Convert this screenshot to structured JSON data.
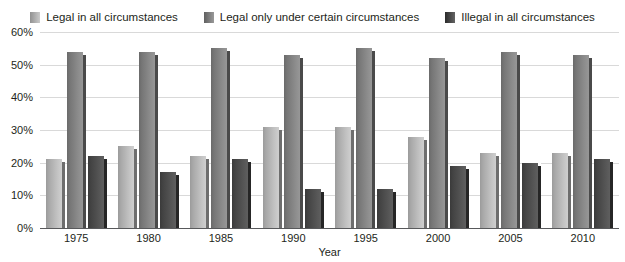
{
  "chart_data": {
    "type": "bar",
    "title": "",
    "subtitle": "",
    "xlabel": "Year",
    "ylabel": "",
    "ylim": [
      0,
      60
    ],
    "ytick_step": 10,
    "ytick_labels": [
      "60%",
      "50%",
      "40%",
      "30%",
      "20%",
      "10%",
      "0%"
    ],
    "ytick_values": [
      60,
      50,
      40,
      30,
      20,
      10,
      0
    ],
    "grid": true,
    "legend_position": "top-center",
    "categories": [
      "1975",
      "1980",
      "1985",
      "1990",
      "1995",
      "2000",
      "2005",
      "2010"
    ],
    "series": [
      {
        "name": "Legal in all circumstances",
        "color": "#b0b0b0",
        "values": [
          21,
          25,
          22,
          31,
          31,
          28,
          23,
          23
        ]
      },
      {
        "name": "Legal only under certain circumstances",
        "color": "#7f7f7f",
        "values": [
          54,
          54,
          55,
          53,
          55,
          52,
          54,
          53
        ]
      },
      {
        "name": "Illegal in all circumstances",
        "color": "#4a4a4a",
        "values": [
          22,
          17,
          21,
          12,
          12,
          19,
          20,
          21
        ]
      }
    ]
  },
  "legend": {
    "items": [
      {
        "label": "Legal in all circumstances",
        "color": "#b0b0b0"
      },
      {
        "label": "Legal only under certain circumstances",
        "color": "#7f7f7f"
      },
      {
        "label": "Illegal in all circumstances",
        "color": "#4a4a4a"
      }
    ]
  },
  "axes": {
    "x_title": "Year",
    "y_ticks": [
      "60%",
      "50%",
      "40%",
      "30%",
      "20%",
      "10%",
      "0%"
    ],
    "x_ticks": [
      "1975",
      "1980",
      "1985",
      "1990",
      "1995",
      "2000",
      "2005",
      "2010"
    ]
  }
}
